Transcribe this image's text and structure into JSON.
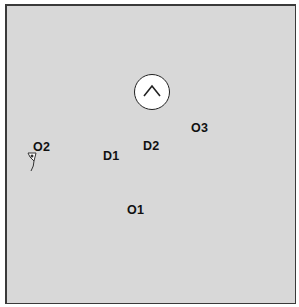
{
  "diagram": {
    "labels": {
      "o1": "O1",
      "o2": "O2",
      "o3": "O3",
      "d1": "D1",
      "d2": "D2"
    },
    "icons": {
      "north": "north-arrow-icon",
      "marker": "map-pin-icon"
    },
    "colors": {
      "background": "#d8d8d8",
      "border": "#3a3a3a",
      "text": "#111111"
    }
  }
}
